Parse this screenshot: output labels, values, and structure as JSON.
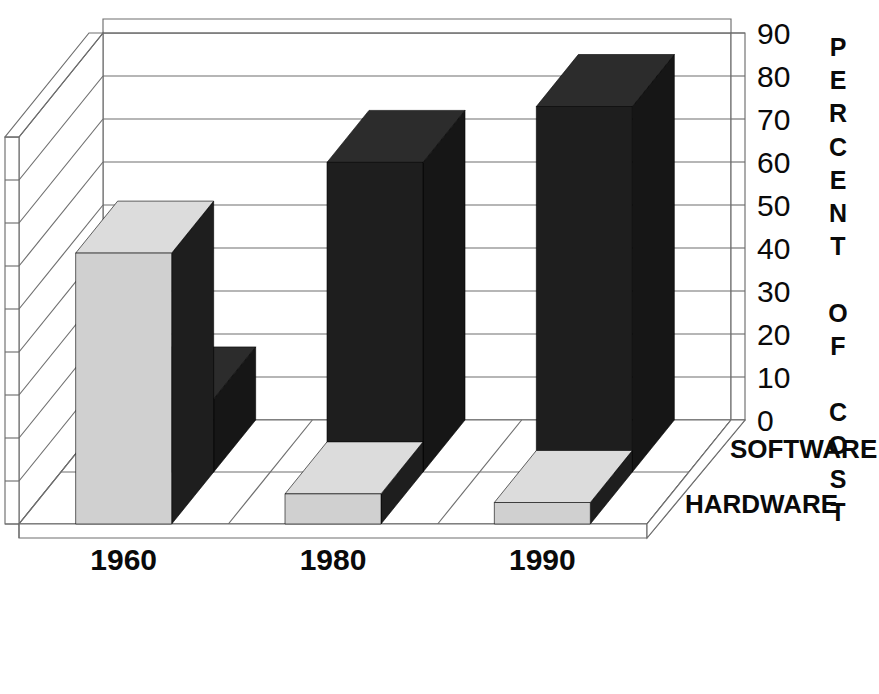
{
  "chart_data": {
    "type": "bar",
    "title": "",
    "subtitle": "",
    "xlabel": "",
    "ylabel": "PERCENT OF COST",
    "ylim": [
      0,
      90
    ],
    "ytick_step": 10,
    "yticks": [
      "90",
      "80",
      "70",
      "60",
      "50",
      "40",
      "30",
      "20",
      "10",
      "0"
    ],
    "categories": [
      "1960",
      "1980",
      "1990"
    ],
    "grid": true,
    "legend_position": "right-depth-axis",
    "projection": "3d-depth-rows",
    "series": [
      {
        "name": "SOFTWARE",
        "color": "#1e1e1e",
        "row": "back",
        "values": [
          17,
          72,
          85
        ]
      },
      {
        "name": "HARDWARE",
        "color": "#d0d0d0",
        "row": "front",
        "values": [
          63,
          7,
          5
        ]
      }
    ],
    "annotations": []
  },
  "axis": {
    "y_title_letters": [
      "P",
      "E",
      "R",
      "C",
      "E",
      "N",
      "T",
      "",
      "O",
      "F",
      "",
      "C",
      "O",
      "S",
      "T"
    ],
    "y_tick_labels": [
      "90",
      "80",
      "70",
      "60",
      "50",
      "40",
      "30",
      "20",
      "10",
      "0"
    ]
  },
  "categories": {
    "labels": [
      "1960",
      "1980",
      "1990"
    ]
  },
  "legend": {
    "back_row_label": "SOFTWARE",
    "front_row_label": "HARDWARE"
  },
  "colors": {
    "software_front": "#1e1e1e",
    "software_top": "#2c2c2c",
    "software_side": "#161616",
    "hardware_front": "#d0d0d0",
    "hardware_top": "#dcdcdc",
    "hardware_side": "#1e1e1e",
    "background": "#ffffff",
    "ink": "#0a0a0a",
    "line": "#6e6e6e"
  }
}
